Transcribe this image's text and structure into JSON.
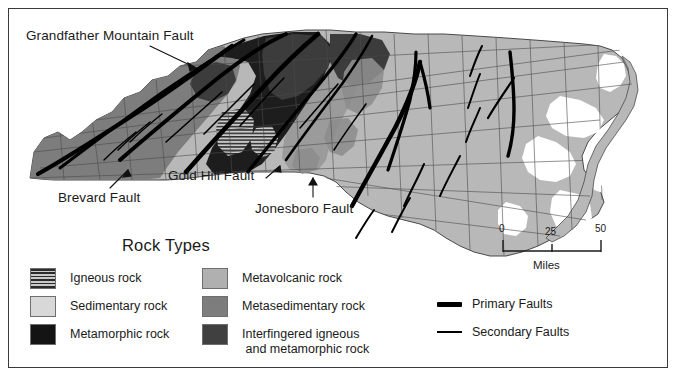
{
  "figure": {
    "background_color": "#ffffff",
    "border_color": "#3a3a3a"
  },
  "annotations": [
    {
      "id": "grandfather",
      "label": "Grandfather Mountain Fault"
    },
    {
      "id": "brevard",
      "label": "Brevard Fault"
    },
    {
      "id": "goldhill",
      "label": "Gold Hill Fault"
    },
    {
      "id": "jonesboro",
      "label": "Jonesboro Fault"
    }
  ],
  "legend": {
    "title": "Rock Types",
    "column_left": [
      {
        "label": "Igneous rock",
        "pattern": "horizontal-stripes",
        "color": "#c9c9c9"
      },
      {
        "label": "Sedimentary rock",
        "pattern": "solid",
        "color": "#d8d8d8"
      },
      {
        "label": "Metamorphic rock",
        "pattern": "solid",
        "color": "#141414"
      }
    ],
    "column_right": [
      {
        "label": "Metavolcanic rock",
        "pattern": "solid",
        "color": "#b0b0b0"
      },
      {
        "label": "Metasedimentary rock",
        "pattern": "solid",
        "color": "#7d7d7d"
      },
      {
        "label": "Interfingered igneous\n and metamorphic rock",
        "pattern": "solid",
        "color": "#404040"
      }
    ],
    "faults": [
      {
        "label": "Primary Faults",
        "style": "thick",
        "color": "#000000"
      },
      {
        "label": "Secondary Faults",
        "style": "thin",
        "color": "#000000"
      }
    ]
  },
  "scalebar": {
    "ticks": [
      "0",
      "25",
      "50"
    ],
    "units": "Miles"
  },
  "map": {
    "region": "North Carolina",
    "colors": {
      "sedimentary": "#d8d8d8",
      "metavolcanic": "#b0b0b0",
      "metasedimentary": "#7d7d7d",
      "metamorphic": "#141414",
      "interfingered": "#404040",
      "igneous_stripe_dark": "#2b2b2b",
      "county_line": "#5a5a5a",
      "fault": "#000000",
      "water": "#ffffff"
    }
  }
}
